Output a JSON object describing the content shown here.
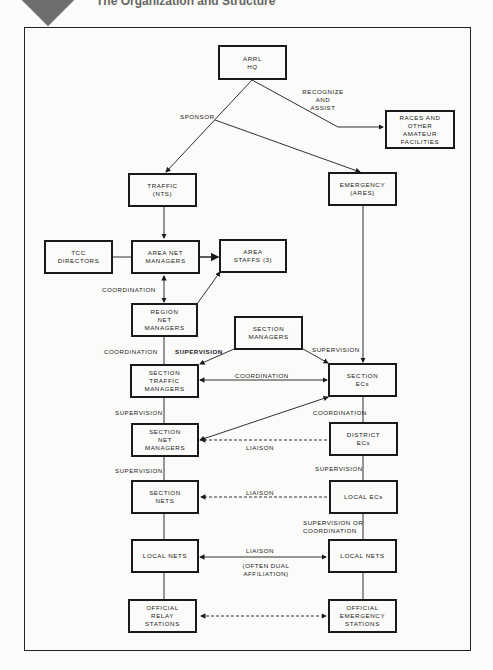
{
  "header": {
    "title": "The Organization and Structure"
  },
  "nodes": {
    "arrl_hq": "ARRL\nHQ",
    "races": "RACES AND\nOTHER\nAMATEUR\nFACILITIES",
    "traffic": "TRAFFIC\n(NTS)",
    "emergency": "EMERGENCY\n(ARES)",
    "tcc_directors": "TCC\nDIRECTORS",
    "area_net_managers": "AREA NET\nMANAGERS",
    "area_staffs": "AREA\nSTAFFS (3)",
    "region_net_managers": "REGION\nNET\nMANAGERS",
    "section_managers": "SECTION\nMANAGERS",
    "section_traffic_managers": "SECTION\nTRAFFIC\nMANAGERS",
    "section_ecs": "SECTION\nECs",
    "section_net_managers": "SECTION\nNET\nMANAGERS",
    "district_ecs": "DISTRICT\nECs",
    "section_nets": "SECTION\nNETS",
    "local_ecs": "LOCAL ECs",
    "local_nets_left": "LOCAL NETS",
    "local_nets_right": "LOCAL NETS",
    "official_relay_stations": "OFFICIAL\nRELAY\nSTATIONS",
    "official_emergency_stations": "OFFICIAL\nEMERGENCY\nSTATIONS"
  },
  "edge_labels": {
    "recognize_assist": "RECOGNIZE\nAND\nASSIST",
    "sponsor": "SPONSOR",
    "coordination_area_region": "COORDINATION",
    "coordination_region_section": "COORDINATION",
    "supervision_left": "SUPERVISION",
    "supervision_right": "SUPERVISION",
    "coordination_stm_secs": "COORDINATION",
    "coordination_secs_district": "COORDINATION",
    "supervision_stm_snm": "SUPERVISION",
    "liaison_snm_district": "LIAISON",
    "supervision_snm_sn": "SUPERVISION",
    "supervision_district_local": "SUPERVISION",
    "liaison_sn_local": "LIAISON",
    "supervision_or_coordination": "SUPERVISION OR\nCOORDINATION",
    "liaison_local_nets": "LIAISON",
    "often_dual": "(OFTEN DUAL\nAFFILIATION)"
  }
}
